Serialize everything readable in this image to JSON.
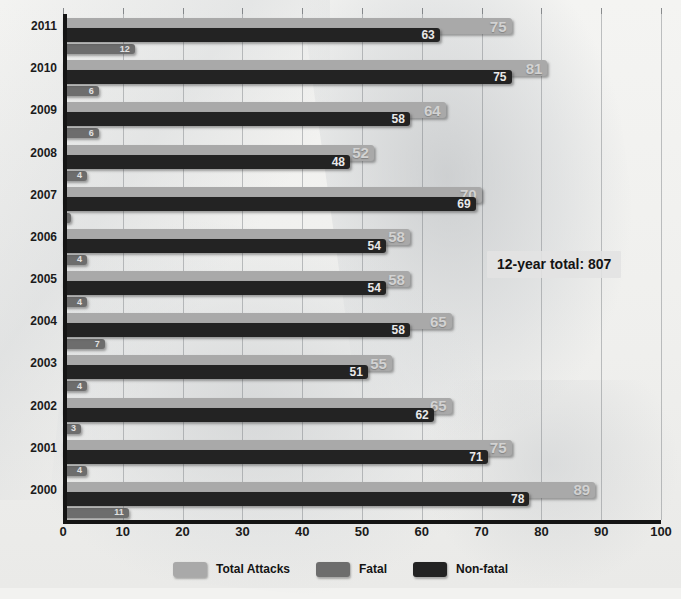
{
  "chart_data": {
    "type": "bar",
    "orientation": "horizontal",
    "title": "",
    "xlabel": "",
    "ylabel": "",
    "xlim": [
      0,
      100
    ],
    "xticks": [
      0,
      10,
      20,
      30,
      40,
      50,
      60,
      70,
      80,
      90,
      100
    ],
    "grid": true,
    "legend_position": "bottom",
    "categories": [
      "2011",
      "2010",
      "2009",
      "2008",
      "2007",
      "2006",
      "2005",
      "2004",
      "2003",
      "2002",
      "2001",
      "2000"
    ],
    "series": [
      {
        "name": "Total Attacks",
        "color": "#a9a9a9",
        "values": [
          75,
          81,
          64,
          52,
          70,
          58,
          58,
          65,
          55,
          65,
          75,
          89
        ]
      },
      {
        "name": "Fatal",
        "color": "#6d6d6d",
        "values": [
          12,
          6,
          6,
          4,
          1,
          4,
          4,
          7,
          4,
          3,
          4,
          11
        ]
      },
      {
        "name": "Non-fatal",
        "color": "#232323",
        "values": [
          63,
          75,
          58,
          48,
          69,
          54,
          54,
          58,
          51,
          62,
          71,
          78
        ]
      }
    ],
    "annotations": [
      {
        "text": "12-year total: 807",
        "x": 82,
        "y": "2006"
      }
    ]
  },
  "legend": {
    "items": [
      {
        "label": "Total Attacks",
        "color": "#a9a9a9"
      },
      {
        "label": "Fatal",
        "color": "#6d6d6d"
      },
      {
        "label": "Non-fatal",
        "color": "#232323"
      }
    ]
  },
  "annotation": {
    "total_label": "12-year total: 807"
  },
  "axis": {
    "x_tick_labels": [
      "0",
      "10",
      "20",
      "30",
      "40",
      "50",
      "60",
      "70",
      "80",
      "90",
      "100"
    ],
    "y_tick_labels": [
      "2011",
      "2010",
      "2009",
      "2008",
      "2007",
      "2006",
      "2005",
      "2004",
      "2003",
      "2002",
      "2001",
      "2000"
    ]
  }
}
